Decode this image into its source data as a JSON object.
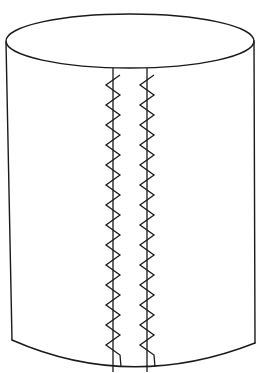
{
  "diagram": {
    "colors": {
      "background": "#ffffff",
      "stroke": "#1a1a1a"
    },
    "cylinder": {
      "top_ellipse": {
        "cx": 130,
        "cy": 41,
        "rx": 124,
        "ry": 27
      },
      "left_side": {
        "x1": 6,
        "y1": 42,
        "x2": 12,
        "y2": 340
      },
      "right_side": {
        "x1": 254,
        "y1": 41,
        "x2": 255,
        "y2": 343
      },
      "bottom_curve": {
        "left": [
          12,
          340
        ],
        "control": [
          130,
          392
        ],
        "right": [
          255,
          343
        ]
      }
    },
    "seams": [
      {
        "name": "left-seam",
        "x": 113,
        "top": 68,
        "bottom": 372,
        "zig_left": 106,
        "zig_right": 120,
        "start_y": 75,
        "end_y": 356,
        "period": 20
      },
      {
        "name": "right-seam",
        "x": 147,
        "top": 68,
        "bottom": 372,
        "zig_left": 140,
        "zig_right": 154,
        "start_y": 75,
        "end_y": 356,
        "period": 20
      }
    ]
  }
}
